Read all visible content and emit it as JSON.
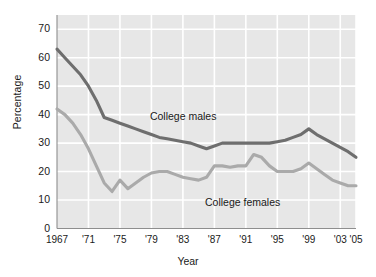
{
  "chart_data": {
    "type": "line",
    "title": "",
    "xlabel": "Year",
    "ylabel": "Percentage",
    "grid": true,
    "legend_position": "inline-annotations",
    "xlim": [
      1967,
      2005
    ],
    "ylim": [
      0,
      75
    ],
    "y_ticks": [
      70,
      60,
      50,
      40,
      30,
      20,
      10,
      0
    ],
    "x_ticks": [
      "1967",
      "'71",
      "'75",
      "'79",
      "'83",
      "'87",
      "'91",
      "'95",
      "'99",
      "'03",
      "'05"
    ],
    "x_tick_years": [
      1967,
      1971,
      1975,
      1979,
      1983,
      1987,
      1991,
      1995,
      1999,
      2003,
      2005
    ],
    "x": [
      1967,
      1968,
      1969,
      1970,
      1971,
      1972,
      1973,
      1974,
      1975,
      1976,
      1977,
      1978,
      1979,
      1980,
      1981,
      1982,
      1983,
      1984,
      1985,
      1986,
      1987,
      1988,
      1989,
      1990,
      1991,
      1992,
      1993,
      1994,
      1995,
      1996,
      1997,
      1998,
      1999,
      2000,
      2001,
      2002,
      2003,
      2004,
      2005
    ],
    "series": [
      {
        "name": "College males",
        "color": "#6e6e6e",
        "label_x": 1983,
        "label_y": 39,
        "values": [
          63,
          60,
          57,
          54,
          50,
          45,
          39,
          38,
          37,
          36,
          35,
          34,
          33,
          32,
          31.5,
          31,
          30.5,
          30,
          29,
          28,
          29,
          30,
          30,
          30,
          30,
          30,
          30,
          30,
          30.5,
          31,
          32,
          33,
          35,
          33,
          31.5,
          30,
          28.5,
          27,
          25
        ]
      },
      {
        "name": "College females",
        "color": "#aaaaaa",
        "label_x": 1990,
        "label_y": 9,
        "values": [
          42,
          40,
          37,
          33,
          28,
          22,
          16,
          13,
          17,
          14,
          16,
          18,
          19.5,
          20,
          20,
          19,
          18,
          17.5,
          17,
          18,
          22,
          22,
          21.5,
          22,
          22,
          26,
          25,
          22,
          20,
          20,
          20,
          21,
          23,
          21,
          19,
          17,
          16,
          15,
          15
        ]
      }
    ]
  },
  "labels": {
    "y_axis_title": "Percentage",
    "x_axis_title": "Year",
    "series_males": "College males",
    "series_females": "College females"
  },
  "colors": {
    "plot_background": "#e7e7e7",
    "gridline": "#ffffff",
    "axis": "#8e8e8e",
    "males_line": "#6e6e6e",
    "females_line": "#aaaaaa",
    "text": "#1a1a1a"
  }
}
